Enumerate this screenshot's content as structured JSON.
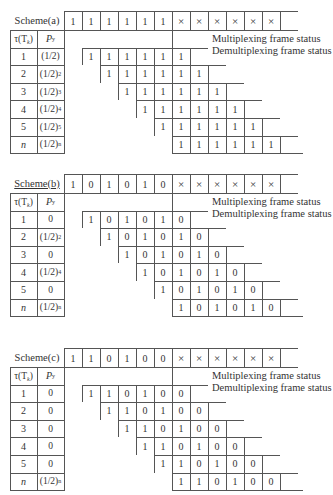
{
  "legend": {
    "mux": "Multiplexing frame status",
    "demux": "Demultiplexing frame status"
  },
  "header": {
    "tau": "τ(T",
    "tau_sub": "k",
    "tau_end": ")",
    "p": "P",
    "p_sub": "y"
  },
  "schemes": [
    {
      "name": "Scheme(a)",
      "frame": [
        "1",
        "1",
        "1",
        "1",
        "1",
        "1",
        "×",
        "×",
        "×",
        "×",
        "×",
        "×"
      ],
      "rows": [
        {
          "tau": "1",
          "p": "(1/2)",
          "p_exp": "",
          "cells": [
            "1",
            "1",
            "1",
            "1",
            "1",
            "1"
          ]
        },
        {
          "tau": "2",
          "p": "(1/2)",
          "p_exp": "2",
          "cells": [
            "1",
            "1",
            "1",
            "1",
            "1",
            "1"
          ]
        },
        {
          "tau": "3",
          "p": "(1/2)",
          "p_exp": "3",
          "cells": [
            "1",
            "1",
            "1",
            "1",
            "1",
            "1"
          ]
        },
        {
          "tau": "4",
          "p": "(1/2)",
          "p_exp": "4",
          "cells": [
            "1",
            "1",
            "1",
            "1",
            "1",
            "1"
          ]
        },
        {
          "tau": "5",
          "p": "(1/2)",
          "p_exp": "5",
          "cells": [
            "1",
            "1",
            "1",
            "1",
            "1",
            "1"
          ]
        },
        {
          "tau": "n",
          "p": "(1/2)",
          "p_exp": "n",
          "cells": [
            "1",
            "1",
            "1",
            "1",
            "1",
            "1"
          ]
        }
      ]
    },
    {
      "name": "Scheme(b)",
      "frame": [
        "1",
        "0",
        "1",
        "0",
        "1",
        "0",
        "×",
        "×",
        "×",
        "×",
        "×",
        "×"
      ],
      "rows": [
        {
          "tau": "1",
          "p": "0",
          "p_exp": "",
          "cells": [
            "1",
            "0",
            "1",
            "0",
            "1",
            "0"
          ]
        },
        {
          "tau": "2",
          "p": "(1/2)",
          "p_exp": "2",
          "cells": [
            "1",
            "0",
            "1",
            "0",
            "1",
            "0"
          ]
        },
        {
          "tau": "3",
          "p": "0",
          "p_exp": "",
          "cells": [
            "1",
            "0",
            "1",
            "0",
            "1",
            "0"
          ]
        },
        {
          "tau": "4",
          "p": "(1/2)",
          "p_exp": "4",
          "cells": [
            "1",
            "0",
            "1",
            "0",
            "1",
            "0"
          ]
        },
        {
          "tau": "5",
          "p": "0",
          "p_exp": "",
          "cells": [
            "1",
            "0",
            "1",
            "0",
            "1",
            "0"
          ]
        },
        {
          "tau": "n",
          "p": "(1/2)",
          "p_exp": "n",
          "cells": [
            "1",
            "0",
            "1",
            "0",
            "1",
            "0"
          ]
        }
      ]
    },
    {
      "name": "Scheme(c)",
      "frame": [
        "1",
        "1",
        "0",
        "1",
        "0",
        "0",
        "×",
        "×",
        "×",
        "×",
        "×",
        "×"
      ],
      "rows": [
        {
          "tau": "1",
          "p": "0",
          "p_exp": "",
          "cells": [
            "1",
            "1",
            "0",
            "1",
            "0",
            "0"
          ]
        },
        {
          "tau": "2",
          "p": "0",
          "p_exp": "",
          "cells": [
            "1",
            "1",
            "0",
            "1",
            "0",
            "0"
          ]
        },
        {
          "tau": "3",
          "p": "0",
          "p_exp": "",
          "cells": [
            "1",
            "1",
            "0",
            "1",
            "0",
            "0"
          ]
        },
        {
          "tau": "4",
          "p": "0",
          "p_exp": "",
          "cells": [
            "1",
            "1",
            "0",
            "1",
            "0",
            "0"
          ]
        },
        {
          "tau": "5",
          "p": "0",
          "p_exp": "",
          "cells": [
            "1",
            "1",
            "0",
            "1",
            "0",
            "0"
          ]
        },
        {
          "tau": "n",
          "p": "(1/2)",
          "p_exp": "n",
          "cells": [
            "1",
            "1",
            "0",
            "1",
            "0",
            "0"
          ]
        }
      ]
    }
  ]
}
